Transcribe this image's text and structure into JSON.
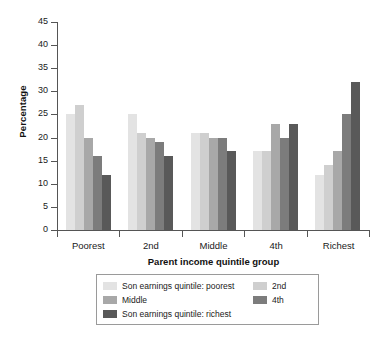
{
  "chart_data": {
    "type": "bar",
    "title": "",
    "xlabel": "Parent income quintile group",
    "ylabel": "Percentage",
    "ylim": [
      0,
      45
    ],
    "ytick_step": 5,
    "yticks": [
      "0",
      "5",
      "10",
      "15",
      "20",
      "25",
      "30",
      "35",
      "40",
      "45"
    ],
    "grid": false,
    "legend_position": "bottom",
    "categories": [
      "Poorest",
      "2nd",
      "Middle",
      "4th",
      "Richest"
    ],
    "series": [
      {
        "name": "Son earnings quintile: poorest",
        "color": "#e3e3e3",
        "values": [
          25,
          25,
          21,
          17,
          12
        ]
      },
      {
        "name": "2nd",
        "color": "#cfcfcf",
        "values": [
          27,
          21,
          21,
          17,
          14
        ]
      },
      {
        "name": "Middle",
        "color": "#a8a8a8",
        "values": [
          20,
          20,
          20,
          23,
          17
        ]
      },
      {
        "name": "4th",
        "color": "#7c7c7c",
        "values": [
          16,
          19,
          20,
          20,
          25
        ]
      },
      {
        "name": "Son earnings quintile: richest",
        "color": "#595959",
        "values": [
          12,
          16,
          17,
          23,
          32
        ]
      }
    ]
  },
  "legend": {
    "entries": [
      {
        "label": "Son earnings quintile: poorest",
        "color": "#e3e3e3"
      },
      {
        "label": "2nd",
        "color": "#cfcfcf"
      },
      {
        "label": "Middle",
        "color": "#a8a8a8"
      },
      {
        "label": "4th",
        "color": "#7c7c7c"
      },
      {
        "label": "Son earnings quintile: richest",
        "color": "#595959"
      }
    ]
  }
}
